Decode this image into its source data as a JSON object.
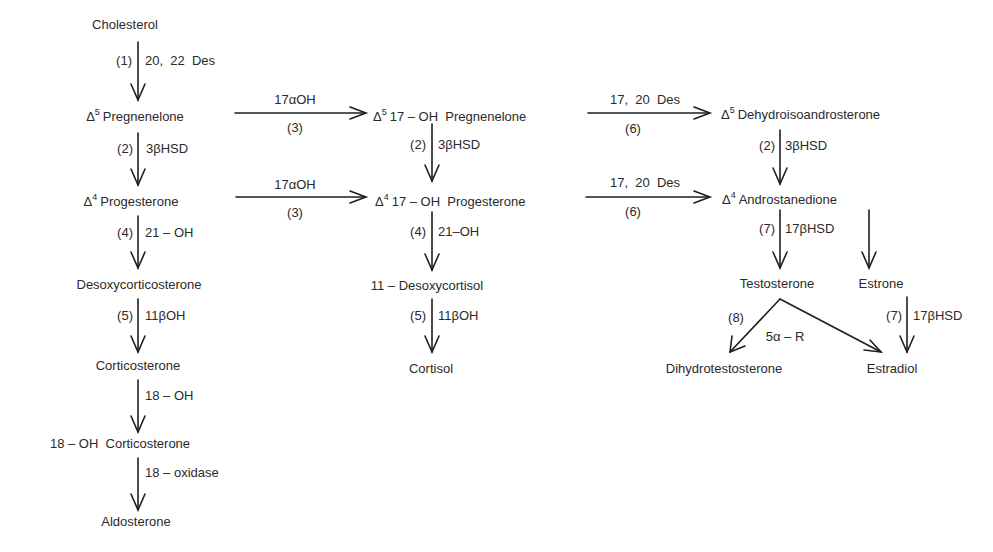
{
  "diagram": {
    "compounds": {
      "cholesterol": "Cholesterol",
      "pregnenelone": {
        "prefix": "Δ",
        "sup": "5",
        "name": "Pregnenelone"
      },
      "progesterone": {
        "prefix": "Δ",
        "sup": "4",
        "name": "Progesterone"
      },
      "desoxycorticosterone": "Desoxycorticosterone",
      "corticosterone": "Corticosterone",
      "oh18_corticosterone": "18 – OH  Corticosterone",
      "aldosterone": "Aldosterone",
      "oh17_pregnenelone": {
        "prefix": "Δ",
        "sup": "5",
        "name": "17 – OH  Pregnenelone"
      },
      "oh17_progesterone": {
        "prefix": "Δ",
        "sup": "4",
        "name": "17 – OH  Progesterone"
      },
      "desoxycortisol": "11 – Desoxycortisol",
      "cortisol": "Cortisol",
      "dehydroisoandrosterone": {
        "prefix": "Δ",
        "sup": "5",
        "name": "Dehydroisoandrosterone"
      },
      "androstanedione": {
        "prefix": "Δ",
        "sup": "4",
        "name": "Androstanedione"
      },
      "testosterone": "Testosterone",
      "estrone": "Estrone",
      "dihydrotestosterone": "Dihydrotestosterone",
      "estradiol": "Estradiol"
    },
    "reactions": {
      "chol_preg": {
        "step": "(1)",
        "enzyme": "20,  22  Des"
      },
      "preg_prog": {
        "step": "(2)",
        "enzyme": "3βHSD"
      },
      "prog_doc": {
        "step": "(4)",
        "enzyme": "21 – OH"
      },
      "doc_cort": {
        "step": "(5)",
        "enzyme": "11βOH"
      },
      "cort_18oh": {
        "step": "",
        "enzyme": "18 – OH"
      },
      "oh18_aldo": {
        "step": "",
        "enzyme": "18 – oxidase"
      },
      "preg_17oh": {
        "step": "(3)",
        "enzyme": "17αOH"
      },
      "prog_17oh": {
        "step": "(3)",
        "enzyme": "17αOH"
      },
      "oh17preg_oh17prog": {
        "step": "(2)",
        "enzyme": "3βHSD"
      },
      "oh17prog_desoxycortisol": {
        "step": "(4)",
        "enzyme": "21–OH"
      },
      "desoxycortisol_cortisol": {
        "step": "(5)",
        "enzyme": "11βOH"
      },
      "oh17preg_dhea": {
        "step": "(6)",
        "enzyme": "17,  20  Des"
      },
      "oh17prog_andro": {
        "step": "(6)",
        "enzyme": "17,  20  Des"
      },
      "dhea_andro": {
        "step": "(2)",
        "enzyme": "3βHSD"
      },
      "andro_testo": {
        "step": "(7)",
        "enzyme": "17βHSD"
      },
      "testo_dht": {
        "step": "(8)",
        "enzyme": "5α – R"
      },
      "estrone_estradiol": {
        "step": "(7)",
        "enzyme": "17βHSD"
      }
    }
  }
}
